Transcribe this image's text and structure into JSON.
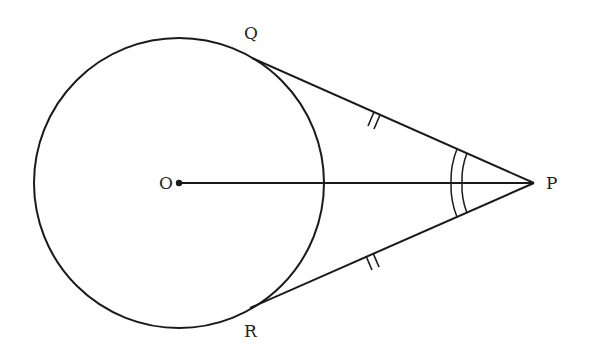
{
  "diagram": {
    "type": "geometry",
    "labels": {
      "O": "O",
      "P": "P",
      "Q": "Q",
      "R": "R"
    },
    "points": {
      "O": [
        179,
        183
      ],
      "P": [
        534,
        183
      ],
      "Q": [
        256,
        60
      ],
      "R": [
        254,
        306
      ]
    },
    "circle": {
      "center": "O",
      "radius": 145
    },
    "segments": [
      [
        "O",
        "P"
      ],
      [
        "Q",
        "P"
      ],
      [
        "R",
        "P"
      ]
    ],
    "marks": {
      "equal_length": [
        "QP",
        "RP"
      ],
      "equal_angles": [
        "QPO",
        "OPR"
      ]
    },
    "colors": {
      "stroke": "#1a1a1a",
      "background": "#ffffff"
    }
  }
}
